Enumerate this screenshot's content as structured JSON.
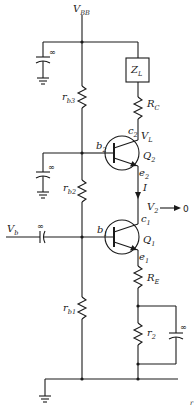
{
  "diagram": {
    "type": "circuit-schematic",
    "supply": {
      "label": "V",
      "sub": "BB"
    },
    "input": {
      "label": "V",
      "sub": "b"
    },
    "components": {
      "load": {
        "label": "Z",
        "sub": "L"
      },
      "rc": {
        "label": "R",
        "sub": "C"
      },
      "re": {
        "label": "R",
        "sub": "E"
      },
      "r2": {
        "label": "r",
        "sub": "2"
      },
      "rb3": {
        "label": "r",
        "sub": "b3"
      },
      "rb2": {
        "label": "r",
        "sub": "b2"
      },
      "rb1": {
        "label": "r",
        "sub": "b1"
      },
      "cap_infinity": "∞"
    },
    "transistors": {
      "q2": {
        "label": "Q",
        "sub": "2",
        "base": "b",
        "base_sub": "2",
        "collector": "c",
        "collector_sub": "2",
        "emitter": "e",
        "emitter_sub": "2"
      },
      "q1": {
        "label": "Q",
        "sub": "1",
        "base": "b",
        "base_sub": "1",
        "collector": "c",
        "collector_sub": "1",
        "emitter": "e",
        "emitter_sub": "1"
      }
    },
    "node_labels": {
      "vl": {
        "label": "V",
        "sub": "L"
      },
      "current": "I",
      "v2": {
        "label": "V",
        "sub": "2"
      },
      "v2_target": "0"
    },
    "corner_mark": "r"
  }
}
